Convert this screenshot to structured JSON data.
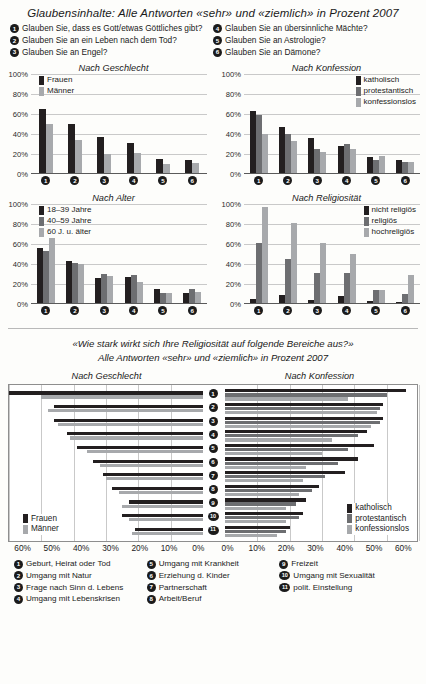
{
  "top_section": {
    "title": "Glaubensinhalte: Alle Antworten «sehr» und «ziemlich» in Prozent 2007",
    "questions_left": [
      {
        "n": "1",
        "text": "Glauben Sie, dass es Gott/etwas Göttliches gibt?"
      },
      {
        "n": "2",
        "text": "Glauben Sie an ein Leben nach dem Tod?"
      },
      {
        "n": "3",
        "text": "Glauben Sie an Engel?"
      }
    ],
    "questions_right": [
      {
        "n": "4",
        "text": "Glauben Sie an übersinnliche Mächte?"
      },
      {
        "n": "5",
        "text": "Glauben Sie an Astrologie?"
      },
      {
        "n": "6",
        "text": "Glauben Sie an Dämone?"
      }
    ]
  },
  "bottom_section": {
    "title_line1": "«Wie stark wirkt sich Ihre Religiosität auf folgende Bereiche aus?»",
    "title_line2": "Alle Antworten «sehr» und «ziemlich» in Prozent 2007",
    "items_col1": [
      {
        "n": "1",
        "text": "Geburt, Heirat oder Tod"
      },
      {
        "n": "2",
        "text": "Umgang mit Natur"
      },
      {
        "n": "3",
        "text": "Frage nach Sinn d. Lebens"
      },
      {
        "n": "4",
        "text": "Umgang mit Lebenskrisen"
      }
    ],
    "items_col2": [
      {
        "n": "5",
        "text": "Umgang mit Krankheit"
      },
      {
        "n": "6",
        "text": "Erziehung d. Kinder"
      },
      {
        "n": "7",
        "text": "Partnerschaft"
      },
      {
        "n": "8",
        "text": "Arbeit/Beruf"
      }
    ],
    "items_col3": [
      {
        "n": "9",
        "text": "Freizeit"
      },
      {
        "n": "10",
        "text": "Umgang mit Sexualität"
      },
      {
        "n": "11",
        "text": "polit. Einstellung"
      }
    ]
  },
  "colors": {
    "dark": "#231f20",
    "mid": "#6d6e71",
    "light": "#a7a9ac",
    "gridline": "#c9c9c9",
    "axis": "#5a5a5a"
  },
  "chart_data": [
    {
      "type": "bar",
      "title": "Nach Geschlecht",
      "categories": [
        "1",
        "2",
        "3",
        "4",
        "5",
        "6"
      ],
      "series": [
        {
          "name": "Frauen",
          "color": "#231f20",
          "values": [
            64,
            49,
            36,
            30,
            14,
            13
          ]
        },
        {
          "name": "Männer",
          "color": "#a7a9ac",
          "values": [
            49,
            33,
            19,
            20,
            9,
            10
          ]
        }
      ],
      "ylabel": "",
      "xlabel": "",
      "ylim": [
        0,
        100
      ],
      "yticks": [
        0,
        20,
        40,
        60,
        80,
        100
      ],
      "ytick_labels": [
        "0%",
        "20%",
        "40%",
        "60%",
        "80%",
        "100%"
      ],
      "grid": true,
      "legend_position": "top-left-inside"
    },
    {
      "type": "bar",
      "title": "Nach Konfession",
      "categories": [
        "1",
        "2",
        "3",
        "4",
        "5",
        "6"
      ],
      "series": [
        {
          "name": "katholisch",
          "color": "#231f20",
          "values": [
            62,
            46,
            35,
            27,
            16,
            13
          ]
        },
        {
          "name": "protestantisch",
          "color": "#6d6e71",
          "values": [
            58,
            39,
            24,
            29,
            13,
            11
          ]
        },
        {
          "name": "konfessionslos",
          "color": "#a7a9ac",
          "values": [
            39,
            32,
            21,
            24,
            17,
            11
          ]
        }
      ],
      "ylabel": "",
      "xlabel": "",
      "ylim": [
        0,
        100
      ],
      "yticks": [
        0,
        20,
        40,
        60,
        80,
        100
      ],
      "ytick_labels": [
        "0%",
        "20%",
        "40%",
        "60%",
        "80%",
        "100%"
      ],
      "grid": true,
      "legend_position": "top-right-inside"
    },
    {
      "type": "bar",
      "title": "Nach Alter",
      "categories": [
        "1",
        "2",
        "3",
        "4",
        "5",
        "6"
      ],
      "series": [
        {
          "name": "18–39 Jahre",
          "color": "#231f20",
          "values": [
            55,
            42,
            25,
            26,
            14,
            10
          ]
        },
        {
          "name": "40–59 Jahre",
          "color": "#6d6e71",
          "values": [
            52,
            40,
            29,
            28,
            10,
            14
          ]
        },
        {
          "name": "60 J. u. älter",
          "color": "#a7a9ac",
          "values": [
            65,
            39,
            27,
            21,
            10,
            11
          ]
        }
      ],
      "ylabel": "",
      "xlabel": "",
      "ylim": [
        0,
        100
      ],
      "yticks": [
        0,
        20,
        40,
        60,
        80,
        100
      ],
      "ytick_labels": [
        "0%",
        "20%",
        "40%",
        "60%",
        "80%",
        "100%"
      ],
      "grid": true,
      "legend_position": "top-left-inside"
    },
    {
      "type": "bar",
      "title": "Nach Religiosität",
      "categories": [
        "1",
        "2",
        "3",
        "4",
        "5",
        "6"
      ],
      "series": [
        {
          "name": "nicht religiös",
          "color": "#231f20",
          "values": [
            4,
            8,
            3,
            7,
            2,
            1
          ]
        },
        {
          "name": "religiös",
          "color": "#6d6e71",
          "values": [
            60,
            44,
            30,
            30,
            13,
            9
          ]
        },
        {
          "name": "hochreligiös",
          "color": "#a7a9ac",
          "values": [
            96,
            80,
            60,
            49,
            13,
            28
          ]
        }
      ],
      "ylabel": "",
      "xlabel": "",
      "ylim": [
        0,
        100
      ],
      "yticks": [
        0,
        20,
        40,
        60,
        80,
        100
      ],
      "ytick_labels": [
        "0%",
        "20%",
        "40%",
        "60%",
        "80%",
        "100%"
      ],
      "grid": true,
      "legend_position": "top-right-inside"
    },
    {
      "type": "bar",
      "orientation": "horizontal-diverging-left",
      "title": "Nach Geschlecht",
      "categories": [
        "1",
        "2",
        "3",
        "4",
        "5",
        "6",
        "7",
        "8",
        "9",
        "10",
        "11"
      ],
      "series": [
        {
          "name": "Frauen",
          "color": "#231f20",
          "values": [
            60,
            46,
            46,
            42,
            39,
            34,
            31,
            28,
            23,
            25,
            21
          ]
        },
        {
          "name": "Männer",
          "color": "#a7a9ac",
          "values": [
            50,
            48,
            45,
            41,
            36,
            32,
            30,
            26,
            25,
            23,
            22
          ]
        }
      ],
      "xlim": [
        0,
        60
      ],
      "xticks": [
        60,
        50,
        40,
        30,
        20,
        10,
        0
      ],
      "xtick_labels": [
        "60%",
        "50%",
        "40%",
        "30%",
        "20%",
        "10%",
        "0%"
      ],
      "grid": true,
      "legend_position": "bottom-left-inside"
    },
    {
      "type": "bar",
      "orientation": "horizontal-diverging-right",
      "title": "Nach Konfession",
      "categories": [
        "1",
        "2",
        "3",
        "4",
        "5",
        "6",
        "7",
        "8",
        "9",
        "10",
        "11"
      ],
      "series": [
        {
          "name": "katholisch",
          "color": "#231f20",
          "values": [
            56,
            49,
            49,
            44,
            46,
            41,
            37,
            29,
            25,
            24,
            20
          ]
        },
        {
          "name": "protestantisch",
          "color": "#6d6e71",
          "values": [
            50,
            48,
            48,
            41,
            38,
            35,
            31,
            27,
            22,
            23,
            19
          ]
        },
        {
          "name": "konfessionslos",
          "color": "#a7a9ac",
          "values": [
            38,
            47,
            45,
            33,
            30,
            25,
            24,
            23,
            19,
            19,
            16
          ]
        }
      ],
      "xlim": [
        0,
        60
      ],
      "xticks": [
        0,
        10,
        20,
        30,
        40,
        50,
        60
      ],
      "xtick_labels": [
        "0%",
        "10%",
        "20%",
        "30%",
        "40%",
        "50%",
        "60%"
      ],
      "grid": true,
      "legend_position": "bottom-right-inside"
    }
  ]
}
